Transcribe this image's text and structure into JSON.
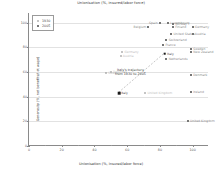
{
  "chart_data": {
    "type": "scatter",
    "title": "Unionisation (%, insured/labor force)",
    "xlabel": "Unionisation (%, insured/labor force)",
    "ylabel": "Generosity (%, net benefits/net wage)",
    "xlim": [
      0,
      110
    ],
    "ylim": [
      0,
      108
    ],
    "xticks": [
      0,
      20,
      40,
      60,
      80,
      100
    ],
    "yticks": [
      0,
      20,
      40,
      60,
      80,
      100
    ],
    "grid": true,
    "legend_position": "top-left",
    "series": [
      {
        "name": "1930",
        "marker": "open-circle",
        "color": "#9c9c9c",
        "points": [
          {
            "label": "Italy",
            "x": 55,
            "y": 43,
            "highlight": true,
            "label_pos": "right",
            "tone": "dark"
          },
          {
            "label": "United Kingdom",
            "x": 71,
            "y": 43,
            "label_pos": "right",
            "tone": "faint"
          },
          {
            "label": "Germany",
            "x": 57,
            "y": 76,
            "label_pos": "right",
            "tone": "faint"
          },
          {
            "label": "Austria",
            "x": 56,
            "y": 73,
            "label_pos": "right",
            "tone": "faint"
          },
          {
            "label": "Denmark",
            "x": 50,
            "y": 60,
            "label_pos": "right",
            "tone": "faint"
          },
          {
            "label": "Sweden",
            "x": 47,
            "y": 59,
            "label_pos": "right",
            "tone": "faint"
          }
        ]
      },
      {
        "name": "2005",
        "marker": "open-square",
        "color": "#777777",
        "points": [
          {
            "label": "Italy",
            "x": 83,
            "y": 75,
            "highlight": true,
            "label_pos": "right",
            "tone": "dark"
          },
          {
            "label": "Belgium",
            "x": 73,
            "y": 97,
            "label_pos": "left"
          },
          {
            "label": "Spain",
            "x": 80,
            "y": 100,
            "label_pos": "left"
          },
          {
            "label": "Luxembourg",
            "x": 85,
            "y": 100,
            "label_pos": "right"
          },
          {
            "label": "Norway",
            "x": 88,
            "y": 99,
            "label_pos": "right"
          },
          {
            "label": "Finland",
            "x": 88,
            "y": 97,
            "label_pos": "right"
          },
          {
            "label": "Germany",
            "x": 100,
            "y": 97,
            "label_pos": "right"
          },
          {
            "label": "United States",
            "x": 87,
            "y": 91,
            "label_pos": "right"
          },
          {
            "label": "Austria",
            "x": 100,
            "y": 91,
            "label_pos": "right"
          },
          {
            "label": "Switzerland",
            "x": 84,
            "y": 86,
            "label_pos": "right"
          },
          {
            "label": "France",
            "x": 82,
            "y": 82,
            "label_pos": "right"
          },
          {
            "label": "Sweden",
            "x": 99,
            "y": 79,
            "label_pos": "right"
          },
          {
            "label": "New Zealand",
            "x": 99,
            "y": 76,
            "label_pos": "right"
          },
          {
            "label": "Netherlands",
            "x": 84,
            "y": 71,
            "label_pos": "right"
          },
          {
            "label": "Denmark",
            "x": 99,
            "y": 58,
            "label_pos": "right"
          },
          {
            "label": "Ireland",
            "x": 99,
            "y": 44,
            "label_pos": "right"
          },
          {
            "label": "United Kingdom",
            "x": 97,
            "y": 20,
            "label_pos": "right"
          }
        ]
      }
    ],
    "annotation": {
      "line1": "Italy's trajectory",
      "line2": "from 1930 to 2005",
      "x": 62,
      "y": 60
    },
    "trajectory": {
      "from": {
        "x": 55,
        "y": 43
      },
      "to": {
        "x": 83,
        "y": 75
      },
      "style": "dashed"
    }
  },
  "legend": {
    "entries": [
      {
        "label": "1930",
        "marker": "open-circle"
      },
      {
        "label": "2005",
        "marker": "open-square"
      }
    ]
  }
}
